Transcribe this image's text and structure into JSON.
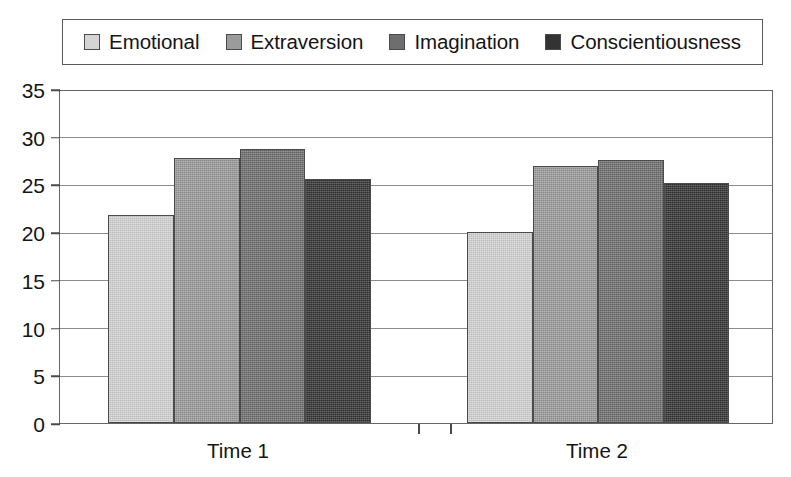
{
  "chart_data": {
    "type": "bar",
    "title": "",
    "xlabel": "",
    "ylabel": "",
    "categories": [
      "Time 1",
      "Time 2"
    ],
    "series": [
      {
        "name": "Emotional",
        "color": "#d4d4d4",
        "values": [
          21.8,
          20.0
        ]
      },
      {
        "name": "Extraversion",
        "color": "#9b9b9b",
        "values": [
          27.8,
          26.9
        ]
      },
      {
        "name": "Imagination",
        "color": "#6e6e6e",
        "values": [
          28.7,
          27.6
        ]
      },
      {
        "name": "Conscientiousness",
        "color": "#333333",
        "values": [
          25.6,
          25.2
        ]
      }
    ],
    "ylim": [
      0,
      35
    ],
    "ytick_step": 5,
    "ytick_labels": [
      "0",
      "5",
      "10",
      "15",
      "20",
      "25",
      "30",
      "35"
    ],
    "grid": true,
    "legend_position": "top",
    "frame_color": "#666666",
    "gridline_color": "#8c8c8c",
    "bar_border_color": "#4a4a4a",
    "background_color": "#ffffff"
  },
  "legend": {
    "items": [
      {
        "label": "Emotional"
      },
      {
        "label": "Extraversion"
      },
      {
        "label": "Imagination"
      },
      {
        "label": "Conscientiousness"
      }
    ]
  }
}
